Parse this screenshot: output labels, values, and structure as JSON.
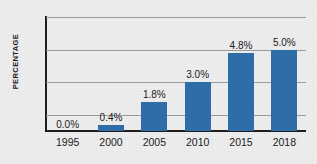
{
  "chart_data": {
    "type": "bar",
    "title": "",
    "xlabel": "",
    "ylabel": "PERCENTAGE",
    "categories": [
      "1995",
      "2000",
      "2005",
      "2010",
      "2015",
      "2018"
    ],
    "values": [
      0.0,
      0.4,
      1.8,
      3.0,
      4.8,
      5.0
    ],
    "data_labels": [
      "0.0%",
      "0.4%",
      "1.8%",
      "3.0%",
      "4.8%",
      "5.0%"
    ],
    "ylim": [
      0,
      7
    ],
    "yticks": [
      0,
      1,
      3,
      5,
      7
    ],
    "ytick_labels": [
      "0",
      "1",
      "3",
      "5",
      "7"
    ],
    "gridlines": [
      "1",
      "3",
      "5",
      "7"
    ],
    "grid": true,
    "legend": null,
    "series": [
      {
        "name": "Percentage",
        "values": [
          0.0,
          0.4,
          1.8,
          3.0,
          4.8,
          5.0
        ]
      }
    ],
    "colors": {
      "bar": "#2e6da8",
      "background": "#ededed",
      "axis": "#1d1d1d",
      "gridline": "#9a9a9a",
      "text": "#1a1a1a"
    }
  }
}
